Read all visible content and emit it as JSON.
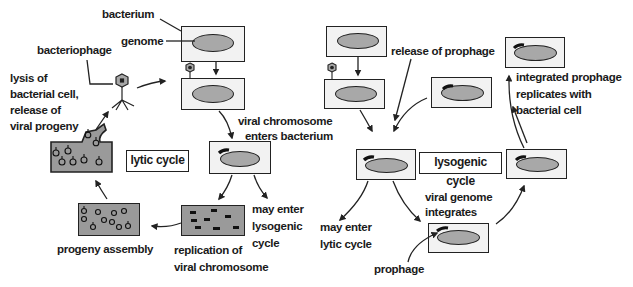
{
  "lytic": {
    "cycle_label": "lytic cycle",
    "labels": {
      "bacterium": "bacterium",
      "genome": "genome",
      "bacteriophage": "bacteriophage",
      "lysis_line1": "lysis of",
      "lysis_line2": "bacterial cell,",
      "lysis_line3": "release of",
      "lysis_line4": "viral progeny",
      "viral_chrom_line1": "viral chromosome",
      "viral_chrom_line2": "enters bacterium",
      "may_enter_lyso_line1": "may enter",
      "may_enter_lyso_line2": "lysogenic",
      "may_enter_lyso_line3": "cycle",
      "replication_line1": "replication of",
      "replication_line2": "viral chromosome",
      "progeny_assembly": "progeny assembly"
    }
  },
  "lysogenic": {
    "cycle_label": "lysogenic cycle",
    "labels": {
      "release_prophage": "release of prophage",
      "integrated_line1": "integrated prophage",
      "integrated_line2": "replicates with",
      "integrated_line3": "bacterial cell",
      "may_enter_lytic_line1": "may enter",
      "may_enter_lytic_line2": "lytic cycle",
      "viral_integrates_line1": "viral genome",
      "viral_integrates_line2": "integrates",
      "prophage": "prophage"
    }
  },
  "colors": {
    "cell_fill": "#f2f2f2",
    "genome_fill": "#a8a8a8",
    "lysed_cell_fill": "#9a9a9a",
    "outline": "#222222"
  }
}
